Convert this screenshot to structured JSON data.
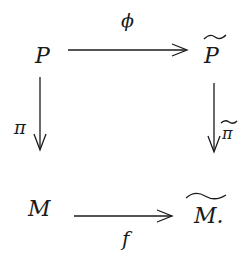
{
  "diagram": {
    "type": "commutative-square",
    "nodes": {
      "top_left": "P",
      "top_right": "P",
      "bottom_left": "M",
      "bottom_right": "M."
    },
    "node_decorations": {
      "top_right": "tilde",
      "bottom_right": "wide-tilde"
    },
    "arrows": {
      "top": {
        "from": "P",
        "to": "P̃",
        "label": "ϕ"
      },
      "left": {
        "from": "P",
        "to": "M",
        "label": "π"
      },
      "right": {
        "from": "P̃",
        "to": "M̃",
        "label": "π",
        "label_decoration": "tilde"
      },
      "bottom": {
        "from": "M",
        "to": "M̃",
        "label": "f"
      }
    }
  }
}
